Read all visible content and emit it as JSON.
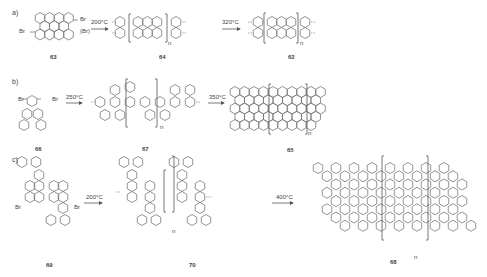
{
  "figure": {
    "type": "reaction-scheme",
    "rows": [
      {
        "label": "a)",
        "compounds": [
          "63",
          "64",
          "62"
        ],
        "conditions": [
          "200°C",
          "320°C"
        ],
        "substituents": [
          "Br",
          "Br",
          "(Br)"
        ],
        "repeat_index": "n"
      },
      {
        "label": "b)",
        "compounds": [
          "66",
          "67",
          "65"
        ],
        "conditions": [
          "250°C",
          "350°C"
        ],
        "substituents": [
          "Br",
          "Br"
        ],
        "repeat_index": "n"
      },
      {
        "label": "c)",
        "compounds": [
          "69",
          "70",
          "68"
        ],
        "conditions": [
          "200°C",
          "400°C"
        ],
        "substituents": [
          "Br",
          "Br"
        ],
        "repeat_index": "n"
      }
    ]
  }
}
